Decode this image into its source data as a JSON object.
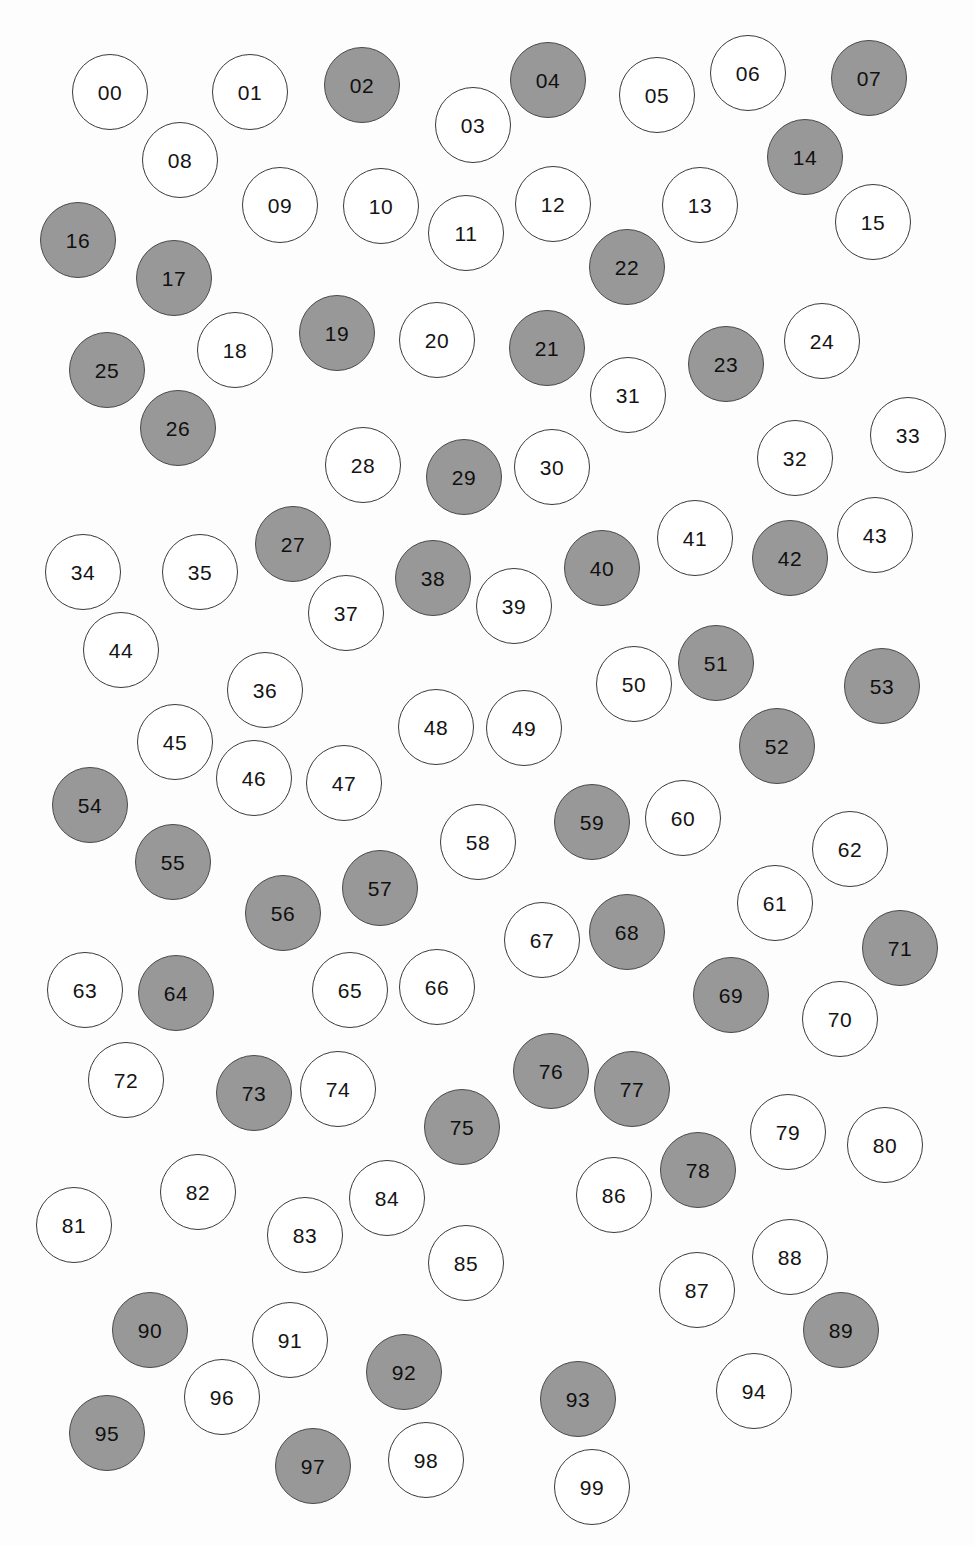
{
  "canvas": {
    "width": 975,
    "height": 1545,
    "background": "#fdfdfd"
  },
  "style": {
    "filled_color": "#989898",
    "unfilled_color": "#ffffff",
    "stroke_color": "#3a3a3a",
    "filled_stroke_color": "#4a4a4a",
    "label_color": "#141414",
    "radius": 38
  },
  "legend": {
    "filled_meaning": "filled",
    "unfilled_meaning": "unfilled"
  },
  "chart_data": {
    "type": "scatter",
    "title": "",
    "xlabel": "",
    "ylabel": "",
    "xlim": [
      0,
      975
    ],
    "ylim": [
      0,
      1545
    ],
    "grid": false,
    "legend_position": "none",
    "marker": "circle",
    "marker_radius": 38,
    "series": [
      {
        "name": "filled",
        "fill": "#989898",
        "labels": [
          "02",
          "04",
          "07",
          "14",
          "16",
          "17",
          "19",
          "21",
          "22",
          "23",
          "25",
          "26",
          "27",
          "29",
          "38",
          "40",
          "42",
          "51",
          "52",
          "53",
          "54",
          "55",
          "56",
          "57",
          "59",
          "64",
          "68",
          "69",
          "71",
          "73",
          "75",
          "76",
          "77",
          "78",
          "89",
          "90",
          "92",
          "93",
          "95",
          "97"
        ]
      },
      {
        "name": "unfilled",
        "fill": "#ffffff",
        "labels": [
          "00",
          "01",
          "03",
          "05",
          "06",
          "08",
          "09",
          "10",
          "11",
          "12",
          "13",
          "15",
          "18",
          "20",
          "24",
          "28",
          "30",
          "31",
          "32",
          "33",
          "34",
          "35",
          "36",
          "37",
          "39",
          "41",
          "43",
          "44",
          "45",
          "46",
          "47",
          "48",
          "49",
          "50",
          "58",
          "60",
          "61",
          "62",
          "63",
          "65",
          "66",
          "67",
          "70",
          "72",
          "74",
          "79",
          "80",
          "81",
          "82",
          "83",
          "84",
          "85",
          "86",
          "87",
          "88",
          "91",
          "94",
          "96",
          "98",
          "99"
        ]
      }
    ],
    "points": [
      {
        "label": "00",
        "x": 110,
        "y": 92,
        "filled": false
      },
      {
        "label": "01",
        "x": 250,
        "y": 92,
        "filled": false
      },
      {
        "label": "02",
        "x": 362,
        "y": 85,
        "filled": true
      },
      {
        "label": "03",
        "x": 473,
        "y": 125,
        "filled": false
      },
      {
        "label": "04",
        "x": 548,
        "y": 80,
        "filled": true
      },
      {
        "label": "05",
        "x": 657,
        "y": 95,
        "filled": false
      },
      {
        "label": "06",
        "x": 748,
        "y": 73,
        "filled": false
      },
      {
        "label": "07",
        "x": 869,
        "y": 78,
        "filled": true
      },
      {
        "label": "08",
        "x": 180,
        "y": 160,
        "filled": false
      },
      {
        "label": "09",
        "x": 280,
        "y": 205,
        "filled": false
      },
      {
        "label": "10",
        "x": 381,
        "y": 206,
        "filled": false
      },
      {
        "label": "11",
        "x": 466,
        "y": 233,
        "filled": false
      },
      {
        "label": "12",
        "x": 553,
        "y": 204,
        "filled": false
      },
      {
        "label": "13",
        "x": 700,
        "y": 205,
        "filled": false
      },
      {
        "label": "14",
        "x": 805,
        "y": 157,
        "filled": true
      },
      {
        "label": "15",
        "x": 873,
        "y": 222,
        "filled": false
      },
      {
        "label": "16",
        "x": 78,
        "y": 240,
        "filled": true
      },
      {
        "label": "17",
        "x": 174,
        "y": 278,
        "filled": true
      },
      {
        "label": "18",
        "x": 235,
        "y": 350,
        "filled": false
      },
      {
        "label": "19",
        "x": 337,
        "y": 333,
        "filled": true
      },
      {
        "label": "20",
        "x": 437,
        "y": 340,
        "filled": false
      },
      {
        "label": "21",
        "x": 547,
        "y": 348,
        "filled": true
      },
      {
        "label": "22",
        "x": 627,
        "y": 267,
        "filled": true
      },
      {
        "label": "23",
        "x": 726,
        "y": 364,
        "filled": true
      },
      {
        "label": "24",
        "x": 822,
        "y": 341,
        "filled": false
      },
      {
        "label": "25",
        "x": 107,
        "y": 370,
        "filled": true
      },
      {
        "label": "26",
        "x": 178,
        "y": 428,
        "filled": true
      },
      {
        "label": "27",
        "x": 293,
        "y": 544,
        "filled": true
      },
      {
        "label": "28",
        "x": 363,
        "y": 465,
        "filled": false
      },
      {
        "label": "29",
        "x": 464,
        "y": 477,
        "filled": true
      },
      {
        "label": "30",
        "x": 552,
        "y": 467,
        "filled": false
      },
      {
        "label": "31",
        "x": 628,
        "y": 395,
        "filled": false
      },
      {
        "label": "32",
        "x": 795,
        "y": 458,
        "filled": false
      },
      {
        "label": "33",
        "x": 908,
        "y": 435,
        "filled": false
      },
      {
        "label": "34",
        "x": 83,
        "y": 572,
        "filled": false
      },
      {
        "label": "35",
        "x": 200,
        "y": 572,
        "filled": false
      },
      {
        "label": "36",
        "x": 265,
        "y": 690,
        "filled": false
      },
      {
        "label": "37",
        "x": 346,
        "y": 613,
        "filled": false
      },
      {
        "label": "38",
        "x": 433,
        "y": 578,
        "filled": true
      },
      {
        "label": "39",
        "x": 514,
        "y": 606,
        "filled": false
      },
      {
        "label": "40",
        "x": 602,
        "y": 568,
        "filled": true
      },
      {
        "label": "41",
        "x": 695,
        "y": 538,
        "filled": false
      },
      {
        "label": "42",
        "x": 790,
        "y": 558,
        "filled": true
      },
      {
        "label": "43",
        "x": 875,
        "y": 535,
        "filled": false
      },
      {
        "label": "44",
        "x": 121,
        "y": 650,
        "filled": false
      },
      {
        "label": "45",
        "x": 175,
        "y": 742,
        "filled": false
      },
      {
        "label": "46",
        "x": 254,
        "y": 778,
        "filled": false
      },
      {
        "label": "47",
        "x": 344,
        "y": 783,
        "filled": false
      },
      {
        "label": "48",
        "x": 436,
        "y": 727,
        "filled": false
      },
      {
        "label": "49",
        "x": 524,
        "y": 728,
        "filled": false
      },
      {
        "label": "50",
        "x": 634,
        "y": 684,
        "filled": false
      },
      {
        "label": "51",
        "x": 716,
        "y": 663,
        "filled": true
      },
      {
        "label": "52",
        "x": 777,
        "y": 746,
        "filled": true
      },
      {
        "label": "53",
        "x": 882,
        "y": 686,
        "filled": true
      },
      {
        "label": "54",
        "x": 90,
        "y": 805,
        "filled": true
      },
      {
        "label": "55",
        "x": 173,
        "y": 862,
        "filled": true
      },
      {
        "label": "56",
        "x": 283,
        "y": 913,
        "filled": true
      },
      {
        "label": "57",
        "x": 380,
        "y": 888,
        "filled": true
      },
      {
        "label": "58",
        "x": 478,
        "y": 842,
        "filled": false
      },
      {
        "label": "59",
        "x": 592,
        "y": 822,
        "filled": true
      },
      {
        "label": "60",
        "x": 683,
        "y": 818,
        "filled": false
      },
      {
        "label": "61",
        "x": 775,
        "y": 903,
        "filled": false
      },
      {
        "label": "62",
        "x": 850,
        "y": 849,
        "filled": false
      },
      {
        "label": "63",
        "x": 85,
        "y": 990,
        "filled": false
      },
      {
        "label": "64",
        "x": 176,
        "y": 993,
        "filled": true
      },
      {
        "label": "65",
        "x": 350,
        "y": 990,
        "filled": false
      },
      {
        "label": "66",
        "x": 437,
        "y": 987,
        "filled": false
      },
      {
        "label": "67",
        "x": 542,
        "y": 940,
        "filled": false
      },
      {
        "label": "68",
        "x": 627,
        "y": 932,
        "filled": true
      },
      {
        "label": "69",
        "x": 731,
        "y": 995,
        "filled": true
      },
      {
        "label": "70",
        "x": 840,
        "y": 1019,
        "filled": false
      },
      {
        "label": "71",
        "x": 900,
        "y": 948,
        "filled": true
      },
      {
        "label": "72",
        "x": 126,
        "y": 1080,
        "filled": false
      },
      {
        "label": "73",
        "x": 254,
        "y": 1093,
        "filled": true
      },
      {
        "label": "74",
        "x": 338,
        "y": 1089,
        "filled": false
      },
      {
        "label": "75",
        "x": 462,
        "y": 1127,
        "filled": true
      },
      {
        "label": "76",
        "x": 551,
        "y": 1071,
        "filled": true
      },
      {
        "label": "77",
        "x": 632,
        "y": 1089,
        "filled": true
      },
      {
        "label": "78",
        "x": 698,
        "y": 1170,
        "filled": true
      },
      {
        "label": "79",
        "x": 788,
        "y": 1132,
        "filled": false
      },
      {
        "label": "80",
        "x": 885,
        "y": 1145,
        "filled": false
      },
      {
        "label": "81",
        "x": 74,
        "y": 1225,
        "filled": false
      },
      {
        "label": "82",
        "x": 198,
        "y": 1192,
        "filled": false
      },
      {
        "label": "83",
        "x": 305,
        "y": 1235,
        "filled": false
      },
      {
        "label": "84",
        "x": 387,
        "y": 1198,
        "filled": false
      },
      {
        "label": "85",
        "x": 466,
        "y": 1263,
        "filled": false
      },
      {
        "label": "86",
        "x": 614,
        "y": 1195,
        "filled": false
      },
      {
        "label": "87",
        "x": 697,
        "y": 1290,
        "filled": false
      },
      {
        "label": "88",
        "x": 790,
        "y": 1257,
        "filled": false
      },
      {
        "label": "89",
        "x": 841,
        "y": 1330,
        "filled": true
      },
      {
        "label": "90",
        "x": 150,
        "y": 1330,
        "filled": true
      },
      {
        "label": "91",
        "x": 290,
        "y": 1340,
        "filled": false
      },
      {
        "label": "92",
        "x": 404,
        "y": 1372,
        "filled": true
      },
      {
        "label": "93",
        "x": 578,
        "y": 1399,
        "filled": true
      },
      {
        "label": "94",
        "x": 754,
        "y": 1391,
        "filled": false
      },
      {
        "label": "95",
        "x": 107,
        "y": 1433,
        "filled": true
      },
      {
        "label": "96",
        "x": 222,
        "y": 1397,
        "filled": false
      },
      {
        "label": "97",
        "x": 313,
        "y": 1466,
        "filled": true
      },
      {
        "label": "98",
        "x": 426,
        "y": 1460,
        "filled": false
      },
      {
        "label": "99",
        "x": 592,
        "y": 1487,
        "filled": false
      }
    ]
  }
}
